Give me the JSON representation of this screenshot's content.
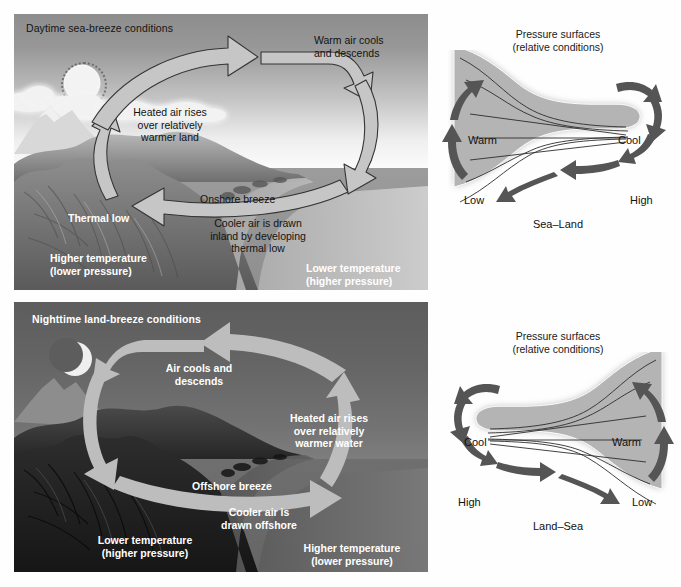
{
  "figure": {
    "panels": [
      {
        "id": "daytime",
        "title": "Daytime sea-breeze conditions",
        "labels": {
          "rises": "Heated air rises\nover relatively\nwarmer land",
          "rises_l1": "Heated air rises",
          "rises_l2": "over relatively",
          "rises_l3": "warmer land",
          "descends_l1": "Warm air cools",
          "descends_l2": "and descends",
          "breeze": "Onshore breeze",
          "drawn_l1": "Cooler air is drawn",
          "drawn_l2": "inland by developing",
          "drawn_l3": "thermal low",
          "thermal_low": "Thermal low",
          "land_temp_l1": "Higher temperature",
          "land_temp_l2": "(lower pressure)",
          "sea_temp_l1": "Lower temperature",
          "sea_temp_l2": "(higher pressure)"
        },
        "icons": {
          "celestial": "sun-icon",
          "clouds": "cloud-icon",
          "terrain": "mountain-range-icon"
        }
      },
      {
        "id": "nighttime",
        "title": "Nighttime land-breeze conditions",
        "labels": {
          "descends_l1": "Air cools and",
          "descends_l2": "descends",
          "rises_l1": "Heated air rises",
          "rises_l2": "over relatively",
          "rises_l3": "warmer water",
          "breeze": "Offshore breeze",
          "drawn_l1": "Cooler air is",
          "drawn_l2": "drawn offshore",
          "land_temp_l1": "Lower temperature",
          "land_temp_l2": "(higher pressure)",
          "sea_temp_l1": "Higher temperature",
          "sea_temp_l2": "(lower pressure)"
        },
        "icons": {
          "celestial": "crescent-moon-icon",
          "terrain": "mountain-range-icon"
        }
      }
    ],
    "pressure_diagrams": [
      {
        "id": "sea-land",
        "heading_l1": "Pressure surfaces",
        "heading_l2": "(relative conditions)",
        "left_temp": "Warm",
        "right_temp": "Cool",
        "left_pressure": "Low",
        "right_pressure": "High",
        "caption": "Sea–Land",
        "flow_direction": "right-to-left",
        "wide_end": "left"
      },
      {
        "id": "land-sea",
        "heading_l1": "Pressure surfaces",
        "heading_l2": "(relative conditions)",
        "left_temp": "Cool",
        "right_temp": "Warm",
        "left_pressure": "High",
        "right_pressure": "Low",
        "caption": "Land–Sea",
        "flow_direction": "left-to-right",
        "wide_end": "right"
      }
    ],
    "colors": {
      "arrow_light": "#c6c6c6",
      "arrow_outline": "#3c3c3c",
      "arrow_dark": "#5e5e5e",
      "pressure_fill": "#b3b3b3",
      "day_sky_top": "#8d8d8d",
      "day_sea": "#969696",
      "night_sky": "#5d5d5d",
      "night_sea": "#6a6a6a",
      "text_dark": "#121212",
      "text_light": "#ffffff"
    }
  }
}
